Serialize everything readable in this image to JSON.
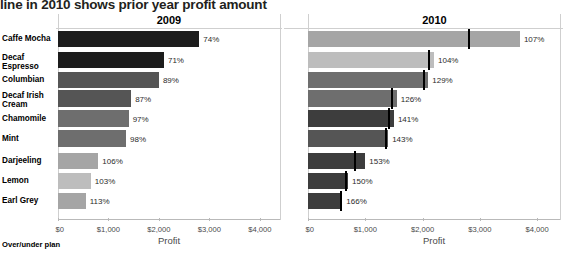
{
  "title": "line in 2010 shows prior year profit amount",
  "footer_label": "Over/under plan",
  "axis": {
    "xlabel": "Profit",
    "ticks": [
      "$0",
      "$1,000",
      "$2,000",
      "$3,000",
      "$4,000"
    ],
    "tick_values": [
      0,
      1000,
      2000,
      3000,
      4000
    ],
    "xlim": [
      0,
      4400
    ]
  },
  "panels": [
    {
      "name": "2009",
      "label": "2009"
    },
    {
      "name": "2010",
      "label": "2010"
    }
  ],
  "colors": {
    "darkest": "#1c1c1c",
    "dark": "#3d3d3d",
    "mid_dark": "#555555",
    "mid": "#6e6e6e",
    "mid_light": "#898989",
    "light": "#a5a5a5",
    "lightest": "#bdbdbd",
    "refline": "#000000",
    "gridline": "#cfcfcf",
    "axis": "#b9b9b9",
    "tick_text": "#4a4a4a"
  },
  "chart_data": {
    "type": "bar",
    "title": "line in 2010 shows prior year profit amount",
    "xlabel": "Profit",
    "ylabel": "",
    "xlim": [
      0,
      4400
    ],
    "grid": false,
    "legend": "none",
    "orientation": "horizontal",
    "categories": [
      "Caffe Mocha",
      "Decaf Espresso",
      "Columbian",
      "Decaf Irish Cream",
      "Chamomile",
      "Mint",
      "Darjeeling",
      "Lemon",
      "Earl Grey"
    ],
    "panels": [
      {
        "name": "2009",
        "values": [
          2800,
          2100,
          2000,
          1450,
          1400,
          1350,
          800,
          650,
          550
        ],
        "labels": [
          "74%",
          "71%",
          "89%",
          "87%",
          "97%",
          "98%",
          "106%",
          "103%",
          "113%"
        ],
        "colors": [
          "#1c1c1c",
          "#1c1c1c",
          "#555555",
          "#555555",
          "#6e6e6e",
          "#6e6e6e",
          "#a5a5a5",
          "#bdbdbd",
          "#a5a5a5"
        ],
        "reference_lines": [
          null,
          null,
          null,
          null,
          null,
          null,
          null,
          null,
          null
        ]
      },
      {
        "name": "2010",
        "values": [
          3700,
          2200,
          2100,
          1550,
          1500,
          1400,
          1000,
          700,
          600
        ],
        "labels": [
          "107%",
          "104%",
          "129%",
          "126%",
          "141%",
          "143%",
          "153%",
          "150%",
          "166%"
        ],
        "colors": [
          "#a5a5a5",
          "#bdbdbd",
          "#6e6e6e",
          "#6e6e6e",
          "#3d3d3d",
          "#555555",
          "#3d3d3d",
          "#3d3d3d",
          "#3d3d3d"
        ],
        "reference_lines": [
          2800,
          2100,
          2000,
          1450,
          1400,
          1350,
          800,
          650,
          550
        ]
      }
    ]
  }
}
